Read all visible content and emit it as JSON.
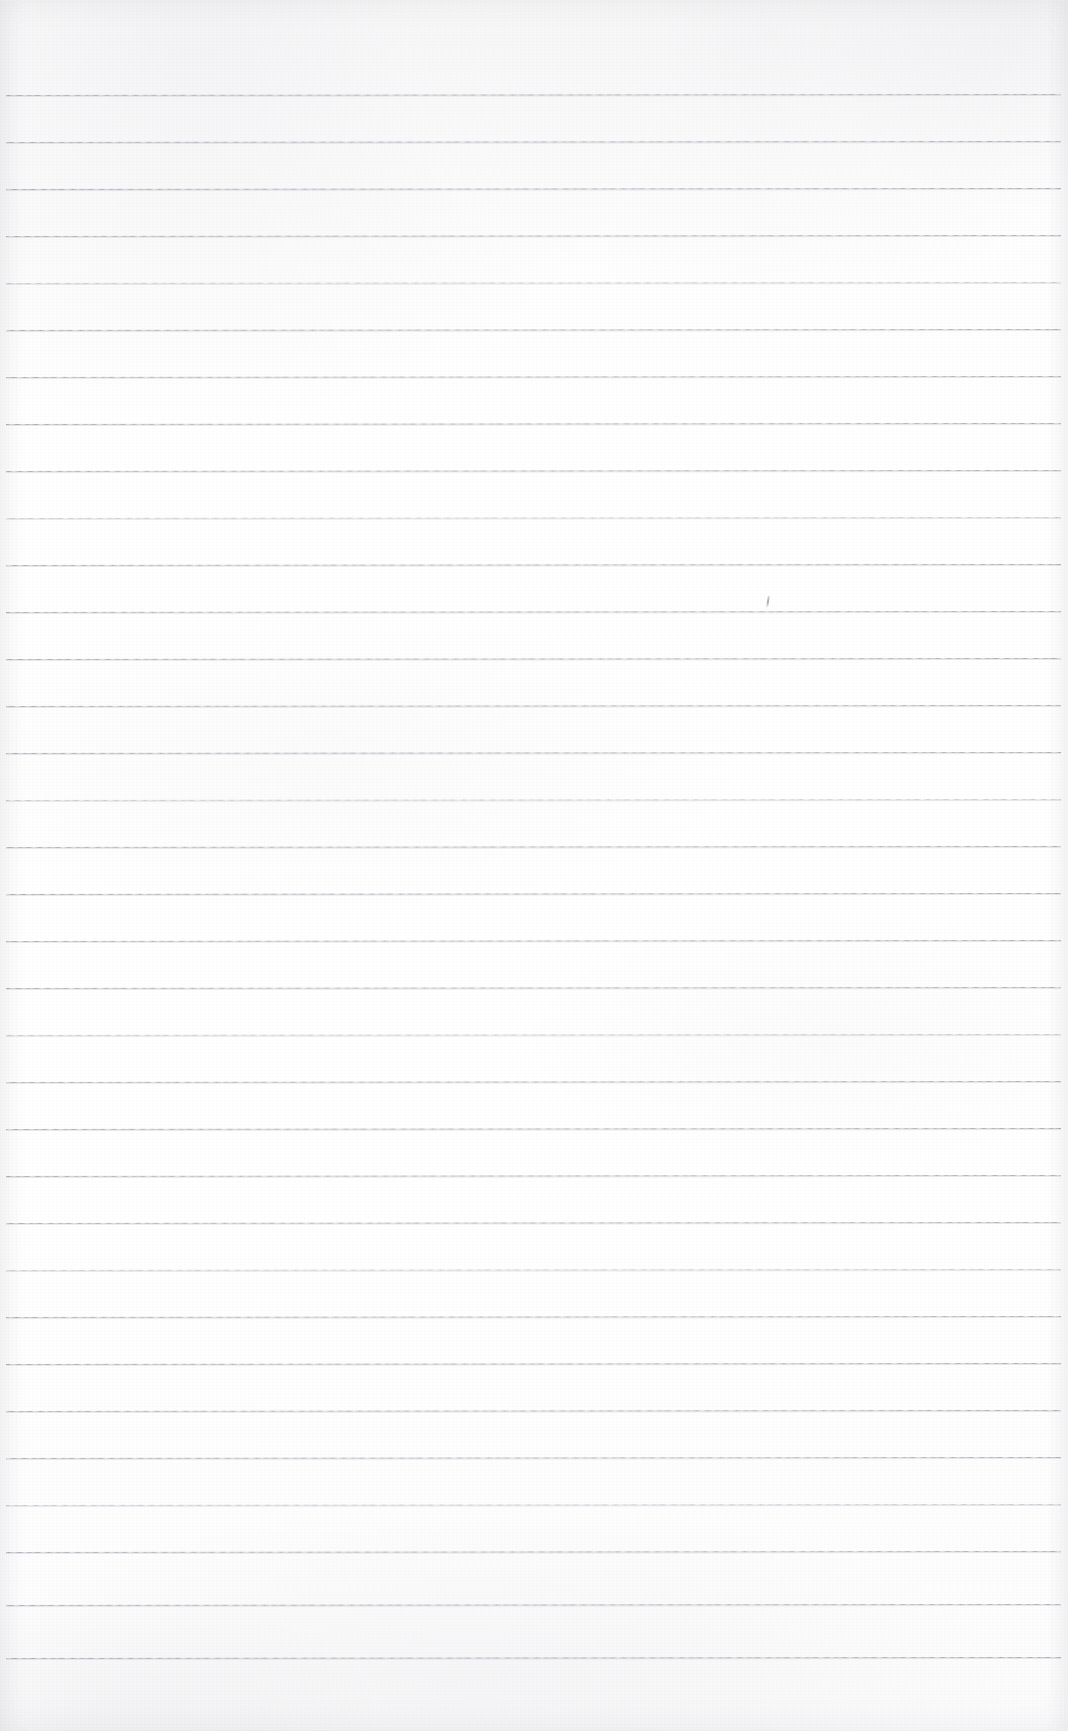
{
  "page": {
    "kind": "scanned-ruled-notebook-page",
    "width": 1068,
    "height": 1731,
    "has_text_content": false,
    "text_content": "",
    "background_color": "#ffffff",
    "paper_tint": "#fdfdfe"
  },
  "ruling": {
    "line_color": "#a9abb3",
    "line_halo_color": "#babcc4",
    "line_thickness_px": 1,
    "line_spacing_px": 47,
    "first_line_y": 95,
    "last_line_y": 1658,
    "line_count": 34,
    "line_start_x": 6,
    "line_end_x": 1061,
    "tilt_degrees": -0.055,
    "lines": [
      {
        "index": 1,
        "y": 95,
        "weight": "normal"
      },
      {
        "index": 2,
        "y": 142,
        "weight": "normal"
      },
      {
        "index": 3,
        "y": 189,
        "weight": "heavy"
      },
      {
        "index": 4,
        "y": 236,
        "weight": "normal"
      },
      {
        "index": 5,
        "y": 283,
        "weight": "light"
      },
      {
        "index": 6,
        "y": 330,
        "weight": "normal"
      },
      {
        "index": 7,
        "y": 377,
        "weight": "normal"
      },
      {
        "index": 8,
        "y": 424,
        "weight": "heavy"
      },
      {
        "index": 9,
        "y": 471,
        "weight": "normal"
      },
      {
        "index": 10,
        "y": 518,
        "weight": "light"
      },
      {
        "index": 11,
        "y": 565,
        "weight": "normal"
      },
      {
        "index": 12,
        "y": 612,
        "weight": "normal"
      },
      {
        "index": 13,
        "y": 659,
        "weight": "heavy"
      },
      {
        "index": 14,
        "y": 706,
        "weight": "normal"
      },
      {
        "index": 15,
        "y": 753,
        "weight": "normal"
      },
      {
        "index": 16,
        "y": 800,
        "weight": "light"
      },
      {
        "index": 17,
        "y": 847,
        "weight": "normal"
      },
      {
        "index": 18,
        "y": 894,
        "weight": "heavy"
      },
      {
        "index": 19,
        "y": 941,
        "weight": "normal"
      },
      {
        "index": 20,
        "y": 988,
        "weight": "normal"
      },
      {
        "index": 21,
        "y": 1035,
        "weight": "light"
      },
      {
        "index": 22,
        "y": 1082,
        "weight": "normal"
      },
      {
        "index": 23,
        "y": 1129,
        "weight": "heavy"
      },
      {
        "index": 24,
        "y": 1176,
        "weight": "normal"
      },
      {
        "index": 25,
        "y": 1223,
        "weight": "normal"
      },
      {
        "index": 26,
        "y": 1270,
        "weight": "light"
      },
      {
        "index": 27,
        "y": 1317,
        "weight": "normal"
      },
      {
        "index": 28,
        "y": 1364,
        "weight": "heavy"
      },
      {
        "index": 29,
        "y": 1411,
        "weight": "normal"
      },
      {
        "index": 30,
        "y": 1458,
        "weight": "normal"
      },
      {
        "index": 31,
        "y": 1505,
        "weight": "light"
      },
      {
        "index": 32,
        "y": 1552,
        "weight": "normal"
      },
      {
        "index": 33,
        "y": 1605,
        "weight": "normal"
      },
      {
        "index": 34,
        "y": 1658,
        "weight": "heavy"
      }
    ]
  },
  "margins": {
    "top_blank_px": 95,
    "bottom_blank_px": 73,
    "left_blank_px": 6,
    "right_blank_px": 7
  },
  "marks": [
    {
      "name": "pencil-tick",
      "x": 767,
      "y": 595,
      "color": "#8e9098",
      "description": "faint stray pencil stroke"
    }
  ]
}
